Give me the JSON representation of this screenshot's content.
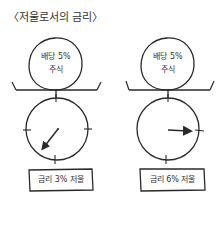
{
  "title": "〈저울로서의 금리〉",
  "colors": {
    "ink": "#2a2a2a",
    "background": "#ffffff"
  },
  "scales": [
    {
      "stock": {
        "line1": "배당 5%",
        "line2": "주식"
      },
      "label": "금리 3% 저울",
      "needle_direction": "lower-left"
    },
    {
      "stock": {
        "line1": "배당 5%",
        "line2": "주식"
      },
      "label": "금리 6% 저울",
      "needle_direction": "right"
    }
  ]
}
